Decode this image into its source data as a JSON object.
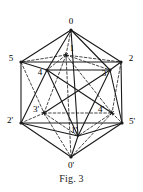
{
  "figure": {
    "caption": "Fig. 3",
    "type": "geometric-solid-diagram",
    "shape_name": "icosahedron",
    "stroke_color": "#1a1a1a",
    "background_color": "#ffffff",
    "hidden_edge_style": "dashed",
    "visible_edge_style": "solid",
    "vertices": [
      {
        "id": "v0",
        "label": "0",
        "x": 71,
        "y": 30,
        "label_x": 71,
        "label_y": 22,
        "marker": "dot"
      },
      {
        "id": "v1",
        "label": "1",
        "x": 66,
        "y": 55,
        "label_x": 72,
        "label_y": 49,
        "marker": "star"
      },
      {
        "id": "v2",
        "label": "2",
        "x": 121,
        "y": 62,
        "label_x": 131,
        "label_y": 59,
        "marker": "dot"
      },
      {
        "id": "v5",
        "label": "5",
        "x": 21,
        "y": 62,
        "label_x": 11,
        "label_y": 59,
        "marker": "dot"
      },
      {
        "id": "v3",
        "label": "3",
        "x": 110,
        "y": 70,
        "label_x": 104,
        "label_y": 74,
        "marker": "dot"
      },
      {
        "id": "v4",
        "label": "4",
        "x": 47,
        "y": 70,
        "label_x": 40,
        "label_y": 73,
        "marker": "dot"
      },
      {
        "id": "v3p",
        "label": "3'",
        "x": 44,
        "y": 113,
        "label_x": 36,
        "label_y": 110,
        "marker": "star"
      },
      {
        "id": "v4p",
        "label": "4'",
        "x": 112,
        "y": 113,
        "label_x": 101,
        "label_y": 110,
        "marker": "star"
      },
      {
        "id": "v2p",
        "label": "2'",
        "x": 21,
        "y": 123,
        "label_x": 10,
        "label_y": 121,
        "marker": "dot"
      },
      {
        "id": "v5p",
        "label": "5'",
        "x": 122,
        "y": 123,
        "label_x": 132,
        "label_y": 122,
        "marker": "dot"
      },
      {
        "id": "v1p",
        "label": "1'",
        "x": 78,
        "y": 136,
        "label_x": 74,
        "label_y": 131,
        "marker": "none"
      },
      {
        "id": "v0p",
        "label": "0'",
        "x": 71,
        "y": 157,
        "label_x": 71,
        "label_y": 166,
        "marker": "dot"
      }
    ],
    "solid_edges": [
      [
        "v0",
        "v5"
      ],
      [
        "v0",
        "v2"
      ],
      [
        "v0",
        "v4"
      ],
      [
        "v0",
        "v3"
      ],
      [
        "v0",
        "v1p"
      ],
      [
        "v5",
        "v2"
      ],
      [
        "v5",
        "v4"
      ],
      [
        "v5",
        "v2p"
      ],
      [
        "v2",
        "v3"
      ],
      [
        "v2",
        "v5p"
      ],
      [
        "v4",
        "v3"
      ],
      [
        "v4",
        "v2p"
      ],
      [
        "v4",
        "v1p"
      ],
      [
        "v3",
        "v5p"
      ],
      [
        "v3",
        "v1p"
      ],
      [
        "v2p",
        "v5p"
      ],
      [
        "v2p",
        "v1p"
      ],
      [
        "v5p",
        "v1p"
      ],
      [
        "v2p",
        "v0p"
      ],
      [
        "v5p",
        "v0p"
      ],
      [
        "v1p",
        "v0p"
      ],
      [
        "v4",
        "v4p"
      ],
      [
        "v3",
        "v3p"
      ]
    ],
    "dashed_edges": [
      [
        "v0",
        "v1"
      ],
      [
        "v1",
        "v5"
      ],
      [
        "v1",
        "v2"
      ],
      [
        "v1",
        "v4"
      ],
      [
        "v1",
        "v3"
      ],
      [
        "v1",
        "v3p"
      ],
      [
        "v1",
        "v4p"
      ],
      [
        "v3p",
        "v4p"
      ],
      [
        "v3p",
        "v2p"
      ],
      [
        "v4p",
        "v5p"
      ],
      [
        "v3p",
        "v0p"
      ],
      [
        "v4p",
        "v0p"
      ],
      [
        "v3p",
        "v1p"
      ],
      [
        "v4p",
        "v1p"
      ],
      [
        "v5",
        "v3p"
      ],
      [
        "v2",
        "v4p"
      ],
      [
        "v0p",
        "v1"
      ]
    ]
  }
}
